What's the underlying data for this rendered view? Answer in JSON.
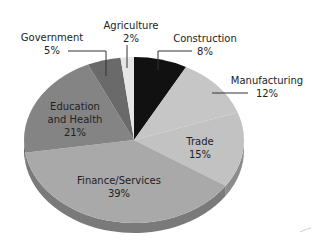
{
  "chart_data": {
    "type": "pie",
    "title": "",
    "style": "3d-tilted",
    "categories": [
      "Construction",
      "Manufacturing",
      "Trade",
      "Finance/Services",
      "Education and Health",
      "Government",
      "Agriculture"
    ],
    "values": [
      8,
      12,
      15,
      39,
      21,
      5,
      2
    ],
    "unit": "%",
    "labels": [
      {
        "name": "Construction",
        "value": "8%"
      },
      {
        "name": "Manufacturing",
        "value": "12%"
      },
      {
        "name": "Trade",
        "value": "15%"
      },
      {
        "name": "Finance/Services",
        "value": "39%"
      },
      {
        "name": "Education and Health",
        "value": "21%"
      },
      {
        "name": "Government",
        "value": "5%"
      },
      {
        "name": "Agriculture",
        "value": "2%"
      }
    ],
    "colors": {
      "Construction": "#111111",
      "Manufacturing": "#c6c6c6",
      "Trade": "#c2c2c2",
      "Finance/Services": "#a9a9a9",
      "Education and Health": "#848484",
      "Government": "#6a6a6a",
      "Agriculture": "#e6e6e6"
    },
    "legend": "none (callout labels)"
  },
  "labels": {
    "construction_name": "Construction",
    "construction_value": "8%",
    "manufacturing_name": "Manufacturing",
    "manufacturing_value": "12%",
    "trade_name": "Trade",
    "trade_value": "15%",
    "finance_name": "Finance/Services",
    "finance_value": "39%",
    "education_name_1": "Education",
    "education_name_2": "and Health",
    "education_value": "21%",
    "government_name": "Government",
    "government_value": "5%",
    "agriculture_name": "Agriculture",
    "agriculture_value": "2%"
  }
}
